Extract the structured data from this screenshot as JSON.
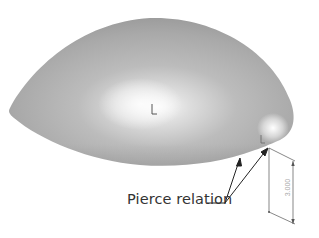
{
  "figure": {
    "callout": {
      "label": "Pierce relation",
      "arrow_count": 2
    },
    "dimension": {
      "value": "3.000",
      "orientation": "vertical"
    },
    "shape": {
      "type": "dome-surface",
      "fill_colors": {
        "base": "#a8a8a8",
        "highlight": "#ffffff",
        "edge": "#8c8c8c"
      }
    },
    "origin_markers": [
      {
        "name": "center-origin",
        "x": 152,
        "y": 110
      },
      {
        "name": "pierce-point-origin",
        "x": 261,
        "y": 141
      }
    ]
  }
}
